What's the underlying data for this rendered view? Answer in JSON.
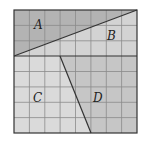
{
  "figure": {
    "grid": {
      "columns": 8,
      "rows": 8
    },
    "regions": [
      {
        "id": "A",
        "label": "A",
        "color": "#b3b3b3"
      },
      {
        "id": "B",
        "label": "B",
        "color": "#d3d3d3"
      },
      {
        "id": "C",
        "label": "C",
        "color": "#dadada"
      },
      {
        "id": "D",
        "label": "D",
        "color": "#c6c6c6"
      }
    ],
    "line_color": "#333333",
    "grid_color": "#8a8a8a"
  }
}
